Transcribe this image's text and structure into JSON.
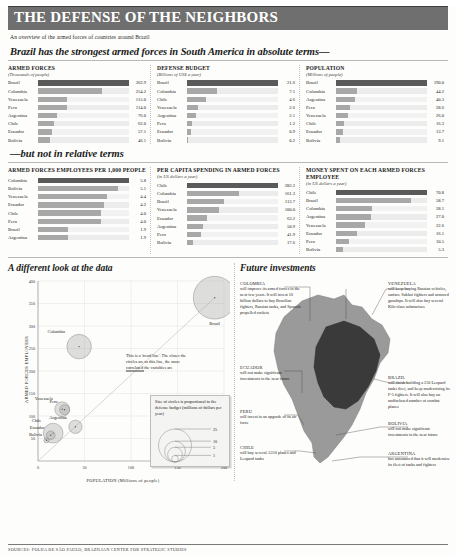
{
  "header": {
    "title": "THE DEFENSE OF THE NEIGHBORS",
    "subtitle": "An overview of the armed forces of countries around Brazil",
    "deck_absolute": "Brazil has the strongest armed forces in South America in absolute terms—",
    "deck_relative": "—but not in relative terms"
  },
  "chart_data": [
    {
      "type": "bar",
      "title": "ARMED FORCES",
      "unit": "(Thousands of people)",
      "categories": [
        "Brazil",
        "Colombia",
        "Venezuela",
        "Peru",
        "Argentina",
        "Chile",
        "Ecuador",
        "Bolivia"
      ],
      "values": [
        362.9,
        254.2,
        115.0,
        114.0,
        76.0,
        62.0,
        57.1,
        46.1
      ],
      "labels": [
        "362.9",
        "254.2",
        "115.0",
        "114.0",
        "76.0",
        "62.0",
        "57.1",
        "46.1"
      ],
      "xlabel": "",
      "ylabel": "",
      "xlim": [
        0,
        362.9
      ],
      "grid": false
    },
    {
      "type": "bar",
      "title": "DEFENSE BUDGET",
      "unit": "(Billions of US$ a year)",
      "categories": [
        "Brazil",
        "Colombia",
        "Chile",
        "Venezuela",
        "Argentina",
        "Peru",
        "Ecuador",
        "Bolivia"
      ],
      "values": [
        21.6,
        7.1,
        4.6,
        2.6,
        2.1,
        1.2,
        0.9,
        0.2
      ],
      "labels": [
        "21.6",
        "7.1",
        "4.6",
        "2.6",
        "2.1",
        "1.2",
        "0.9",
        "0.2"
      ],
      "xlabel": "",
      "ylabel": "",
      "xlim": [
        0,
        21.6
      ],
      "grid": false
    },
    {
      "type": "bar",
      "title": "POPULATION",
      "unit": "(Millions of people)",
      "categories": [
        "Brazil",
        "Colombia",
        "Argentina",
        "Peru",
        "Venezuela",
        "Chile",
        "Ecuador",
        "Bolivia"
      ],
      "values": [
        190.0,
        44.2,
        40.3,
        28.6,
        26.0,
        16.3,
        13.7,
        9.1
      ],
      "labels": [
        "190.0",
        "44.2",
        "40.3",
        "28.6",
        "26.0",
        "16.3",
        "13.7",
        "9.1"
      ],
      "xlabel": "",
      "ylabel": "",
      "xlim": [
        0,
        190.0
      ],
      "grid": false
    },
    {
      "type": "bar",
      "title": "ARMED FORCES EMPLOYEES PER 1,000 PEOPLE",
      "unit": "",
      "categories": [
        "Colombia",
        "Bolivia",
        "Venezuela",
        "Ecuador",
        "Chile",
        "Peru",
        "Brazil",
        "Argentina"
      ],
      "values": [
        5.8,
        5.1,
        4.4,
        4.2,
        4.0,
        4.0,
        1.9,
        1.9
      ],
      "labels": [
        "5.8",
        "5.1",
        "4.4",
        "4.2",
        "4.0",
        "4.0",
        "1.9",
        "1.9"
      ],
      "xlabel": "",
      "ylabel": "",
      "xlim": [
        0,
        5.8
      ],
      "grid": false
    },
    {
      "type": "bar",
      "title": "PER CAPITA SPENDING IN ARMED FORCES",
      "unit": "(in US dollars a year)",
      "categories": [
        "Chile",
        "Colombia",
        "Brazil",
        "Venezuela",
        "Ecuador",
        "Argentina",
        "Peru",
        "Bolivia"
      ],
      "values": [
        282.2,
        161.3,
        113.7,
        100.0,
        63.2,
        50.9,
        41.9,
        17.6
      ],
      "labels": [
        "282.2",
        "161.3",
        "113.7",
        "100.0",
        "63.2",
        "50.9",
        "41.9",
        "17.6"
      ],
      "xlabel": "",
      "ylabel": "",
      "xlim": [
        0,
        282.2
      ],
      "grid": false
    },
    {
      "type": "bar",
      "title": "MONEY SPENT ON EACH ARMED FORCES EMPLOYEE",
      "unit": "(in US dollars a year)",
      "categories": [
        "Chile",
        "Brazil",
        "Colombia",
        "Argentina",
        "Venezuela",
        "Ecuador",
        "Peru",
        "Bolivia"
      ],
      "values": [
        70.8,
        58.7,
        28.1,
        27.0,
        22.6,
        16.1,
        10.5,
        5.3
      ],
      "labels": [
        "70.8",
        "58.7",
        "28.1",
        "27.0",
        "22.6",
        "16.1",
        "10.5",
        "5.3"
      ],
      "xlabel": "",
      "ylabel": "",
      "xlim": [
        0,
        70.8
      ],
      "grid": false
    },
    {
      "type": "scatter",
      "title": "A different look at the data",
      "xlabel": "POPULATION (Millions of people)",
      "ylabel": "ARMED FORCES EMPLOYEES",
      "xlim": [
        0,
        200
      ],
      "ylim": [
        0,
        400
      ],
      "xticks": [
        "0",
        "50",
        "100",
        "150",
        "200"
      ],
      "yticks": [
        "50",
        "100",
        "150",
        "200",
        "250",
        "300",
        "350",
        "400"
      ],
      "grid": true,
      "points": [
        {
          "name": "Brazil",
          "x": 190.0,
          "y": 362.9,
          "size": 21.6
        },
        {
          "name": "Colombia",
          "x": 44.2,
          "y": 254.2,
          "size": 7.1
        },
        {
          "name": "Venezuela",
          "x": 26.0,
          "y": 115.0,
          "size": 2.6
        },
        {
          "name": "Peru",
          "x": 28.6,
          "y": 114.0,
          "size": 1.2
        },
        {
          "name": "Argentina",
          "x": 40.3,
          "y": 76.0,
          "size": 2.1
        },
        {
          "name": "Chile",
          "x": 16.3,
          "y": 62.0,
          "size": 4.6
        },
        {
          "name": "Ecuador",
          "x": 13.7,
          "y": 57.1,
          "size": 0.9
        },
        {
          "name": "Bolivia",
          "x": 9.1,
          "y": 46.1,
          "size": 0.2
        }
      ],
      "annotations": {
        "trend": "This is a 'trend line'. The closer the circles are to this line, the more correlated the variables are",
        "legend_title": "Size of circles is proportional to the defense budget (millions of dollars per year)",
        "legend_values": [
          "25",
          "10",
          "5",
          "1"
        ]
      }
    }
  ],
  "map": {
    "title": "Future investments",
    "callouts": [
      {
        "country": "COLOMBIA",
        "text": "will improve its armed forces in the next few years. It will invest 10 billion dollars to buy Brazilian fighters, Russian tanks, and Spanish propelled rockets"
      },
      {
        "country": "VENEZUELA",
        "text": "will keep buying Russian vehicles, surface Sukhoi fighters and armored gunships. It will also buy several Kilo class submarines"
      },
      {
        "country": "ECUADOR",
        "text": "will not make significant investments in the near future"
      },
      {
        "country": "BRAZIL",
        "text": "will finish building a 250 Leopard tanks fleet, and keep modernizing its F-5 fighters. It will also buy an undisclosed number of combat planes"
      },
      {
        "country": "PERU",
        "text": "will invest in an upgrade of its air force"
      },
      {
        "country": "BOLIVIA",
        "text": "will not make significant investments in the near future"
      },
      {
        "country": "CHILE",
        "text": "will buy several A310 planes and Leopard tanks"
      },
      {
        "country": "ARGENTINA",
        "text": "has announced that it will modernize its fleet of tanks and fighters"
      }
    ]
  },
  "footer": {
    "sources": "SOURCES: FOLHA DE SÃO PAULO, BRAZILIAN CENTER FOR STRATEGIC STUDIES"
  },
  "colors": {
    "masthead_bg": "#6f6f6f",
    "bar": "#a8a8a8",
    "bar_lead": "#5a5a5a",
    "map_brazil": "#3a3a3a",
    "map_other": "#9a9a9a"
  }
}
